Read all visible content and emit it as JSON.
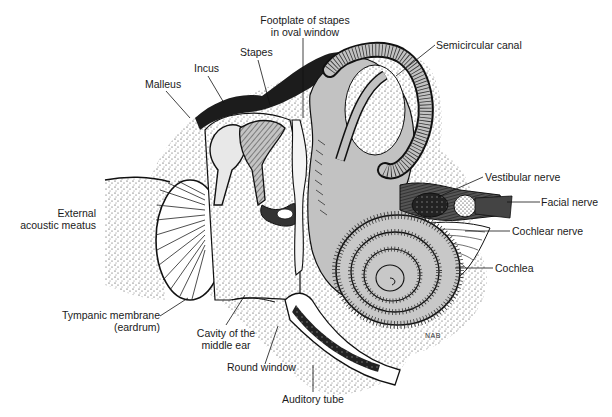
{
  "diagram": {
    "labels": {
      "footplate_line1": "Footplate of stapes",
      "footplate_line2": "in oval window",
      "stapes": "Stapes",
      "incus": "Incus",
      "malleus": "Malleus",
      "semicircular_canal": "Semicircular canal",
      "vestibular_nerve": "Vestibular nerve",
      "facial_nerve": "Facial nerve",
      "cochlear_nerve": "Cochlear nerve",
      "cochlea": "Cochlea",
      "external_line1": "External",
      "external_line2": "acoustic meatus",
      "tympanic_line1": "Tympanic membrane",
      "tympanic_line2": "(eardrum)",
      "cavity_line1": "Cavity of the",
      "cavity_line2": "middle ear",
      "round_window": "Round window",
      "auditory_tube": "Auditory tube"
    },
    "signature": "NAB",
    "colors": {
      "ink": "#1a1a1a",
      "bone_gray": "#b8b8b8",
      "light_gray": "#d6d6d6",
      "background": "#ffffff"
    }
  }
}
